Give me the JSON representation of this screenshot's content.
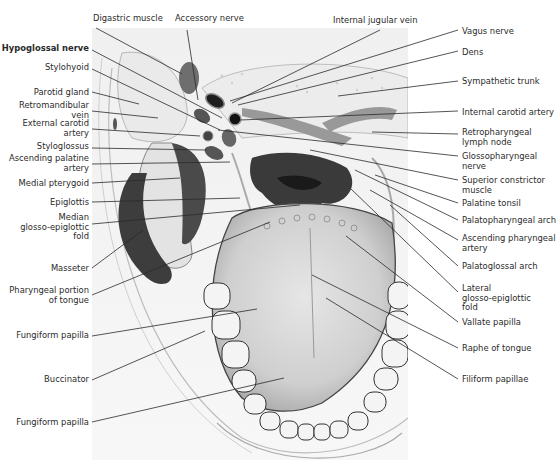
{
  "figure": {
    "colors": {
      "background": "#ffffff",
      "ink": "#2a2a2a",
      "tissue_light": "#e9e9e9",
      "tissue_mid": "#9a9a9a",
      "tissue_dark": "#3c3c3c"
    }
  },
  "labels": {
    "top": [
      {
        "text": "Digastric muscle",
        "x": 93,
        "y": 14
      },
      {
        "text": "Accessory nerve",
        "x": 175,
        "y": 14
      },
      {
        "text": "Internal jugular vein",
        "x": 333,
        "y": 16
      }
    ],
    "left": [
      {
        "text": "Hypoglossal nerve",
        "y": 44,
        "bold": true
      },
      {
        "text": "Stylohyoid",
        "y": 63
      },
      {
        "text": "Parotid gland",
        "y": 88
      },
      {
        "text": "Retromandibular\nvein",
        "y": 101
      },
      {
        "text": "External carotid\nartery",
        "y": 119
      },
      {
        "text": "Styloglossus",
        "y": 142
      },
      {
        "text": "Ascending palatine\nartery",
        "y": 154
      },
      {
        "text": "Medial pterygoid",
        "y": 179
      },
      {
        "text": "Epiglottis",
        "y": 198
      },
      {
        "text": "Median\nglosso-epiglottic\nfold",
        "y": 213
      },
      {
        "text": "Masseter",
        "y": 264
      },
      {
        "text": "Pharyngeal portion\nof tongue",
        "y": 286
      },
      {
        "text": "Fungiform papilla",
        "y": 331
      },
      {
        "text": "Buccinator",
        "y": 375
      },
      {
        "text": "Fungiform papilla",
        "y": 418
      }
    ],
    "right": [
      {
        "text": "Vagus nerve",
        "y": 27
      },
      {
        "text": "Dens",
        "y": 48
      },
      {
        "text": "Sympathetic trunk",
        "y": 77
      },
      {
        "text": "Internal carotid artery",
        "y": 108
      },
      {
        "text": "Retropharyngeal\nlymph node",
        "y": 128
      },
      {
        "text": "Glossopharyngeal\nnerve",
        "y": 152
      },
      {
        "text": "Superior constrictor\nmuscle",
        "y": 176
      },
      {
        "text": "Palatine tonsil",
        "y": 199
      },
      {
        "text": "Palatopharyngeal arch",
        "y": 216
      },
      {
        "text": "Ascending pharyngeal\nartery",
        "y": 234
      },
      {
        "text": "Palatoglossal arch",
        "y": 262
      },
      {
        "text": "Lateral\nglosso-epiglottic\nfold",
        "y": 284
      },
      {
        "text": "Vallate papilla",
        "y": 318
      },
      {
        "text": "Raphe of tongue",
        "y": 344
      },
      {
        "text": "Filiform papillae",
        "y": 375
      }
    ]
  }
}
